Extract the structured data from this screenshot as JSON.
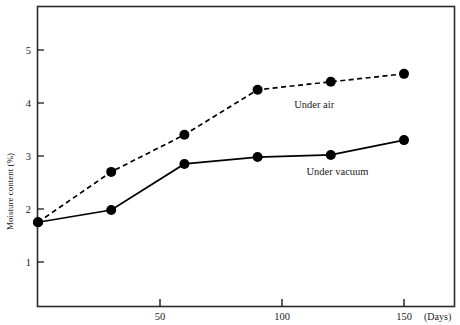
{
  "chart_data": {
    "type": "line",
    "title": "",
    "subtitle": "",
    "xlabel": "(Days)",
    "ylabel": "Moisture  content  (%)",
    "x": [
      0,
      30,
      60,
      90,
      120,
      150
    ],
    "xlim": [
      0,
      170
    ],
    "ylim": [
      0,
      5.65
    ],
    "xticks": [
      50,
      100,
      150
    ],
    "xticklabels": [
      "50",
      "100",
      "150"
    ],
    "yticks": [
      1,
      2,
      3,
      4,
      5
    ],
    "yticklabels": [
      "1",
      "2",
      "3",
      "4",
      "5"
    ],
    "grid": false,
    "legend_position": "inline-annotation",
    "series": [
      {
        "name": "Under air",
        "values": [
          1.75,
          2.7,
          3.4,
          4.25,
          4.4,
          4.55
        ],
        "linestyle": "dashed",
        "marker": "filled-circle",
        "color": "#000000",
        "annotation": "Under air",
        "annotation_x": 105,
        "annotation_y": 3.9
      },
      {
        "name": "Under vacuum",
        "values": [
          1.75,
          1.98,
          2.85,
          2.98,
          3.02,
          3.3
        ],
        "linestyle": "solid",
        "marker": "filled-circle",
        "color": "#000000",
        "annotation": "Under vacuum",
        "annotation_x": 110,
        "annotation_y": 2.65
      }
    ]
  },
  "colors": {
    "frame": "#2b2b2b",
    "ink": "#111111",
    "background": "#ffffff"
  }
}
